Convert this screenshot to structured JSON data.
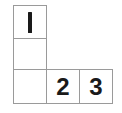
{
  "figure": {
    "type": "cell-grid",
    "shape": "L-shaped polyomino",
    "background_color": "#ffffff",
    "border_color": "#9a9a9a",
    "text_color": "#1a1a1a",
    "rows": 3,
    "columns": 3,
    "cells": [
      {
        "row": 0,
        "col": 0,
        "label": "1",
        "filled": true,
        "glyph_style": "bar"
      },
      {
        "row": 1,
        "col": 0,
        "label": "",
        "filled": true,
        "glyph_style": "none"
      },
      {
        "row": 2,
        "col": 0,
        "label": "",
        "filled": true,
        "glyph_style": "none"
      },
      {
        "row": 2,
        "col": 1,
        "label": "2",
        "filled": true,
        "glyph_style": "digit"
      },
      {
        "row": 2,
        "col": 2,
        "label": "3",
        "filled": true,
        "glyph_style": "digit"
      }
    ],
    "labels_in_order": [
      "1",
      "2",
      "3"
    ]
  }
}
